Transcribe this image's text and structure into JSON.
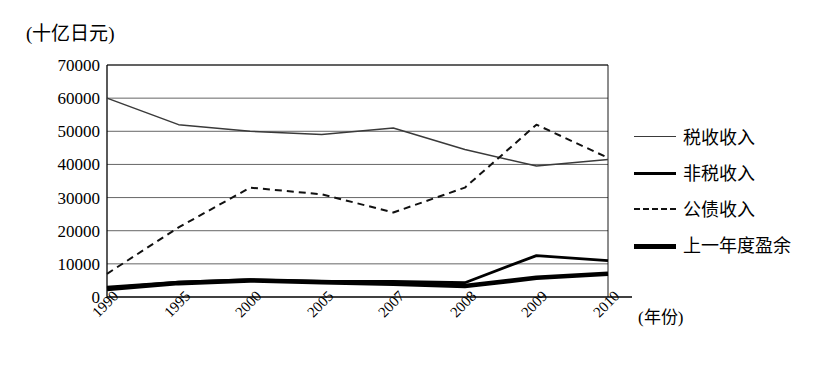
{
  "chart_data": {
    "type": "line",
    "title": "",
    "unit_label": "(十亿日元)",
    "xlabel": "(年份)",
    "ylabel": "",
    "categories": [
      "1990",
      "1995",
      "2000",
      "2005",
      "2007",
      "2008",
      "2009",
      "2010"
    ],
    "ylim": [
      0,
      70000
    ],
    "ytick_step": 10000,
    "yticks": [
      "70000",
      "60000",
      "50000",
      "40000",
      "30000",
      "20000",
      "10000",
      "0"
    ],
    "grid": true,
    "legend_position": "right",
    "series": [
      {
        "name": "税收收入",
        "style": "thin-solid",
        "color": "#3a3a3a",
        "values": [
          60000,
          52000,
          50000,
          49000,
          51000,
          44500,
          39500,
          41500
        ]
      },
      {
        "name": "非税收入",
        "style": "medium-solid",
        "color": "#000000",
        "values": [
          3000,
          4500,
          5200,
          4700,
          4700,
          4300,
          12500,
          11000
        ]
      },
      {
        "name": "公债收入",
        "style": "dashed",
        "color": "#111111",
        "values": [
          7000,
          21000,
          33000,
          31000,
          25500,
          33000,
          52000,
          42000
        ]
      },
      {
        "name": "上一年度盈余",
        "style": "thick-solid",
        "color": "#000000",
        "values": [
          2400,
          4200,
          5000,
          4500,
          4000,
          3300,
          5800,
          7000
        ]
      }
    ]
  },
  "legend": {
    "items": [
      {
        "label": "税收收入"
      },
      {
        "label": "非税收入"
      },
      {
        "label": "公债收入"
      },
      {
        "label": "上一年度盈余"
      }
    ]
  },
  "axes": {
    "unit_label": "(十亿日元)",
    "x_axis_label": "(年份)"
  }
}
